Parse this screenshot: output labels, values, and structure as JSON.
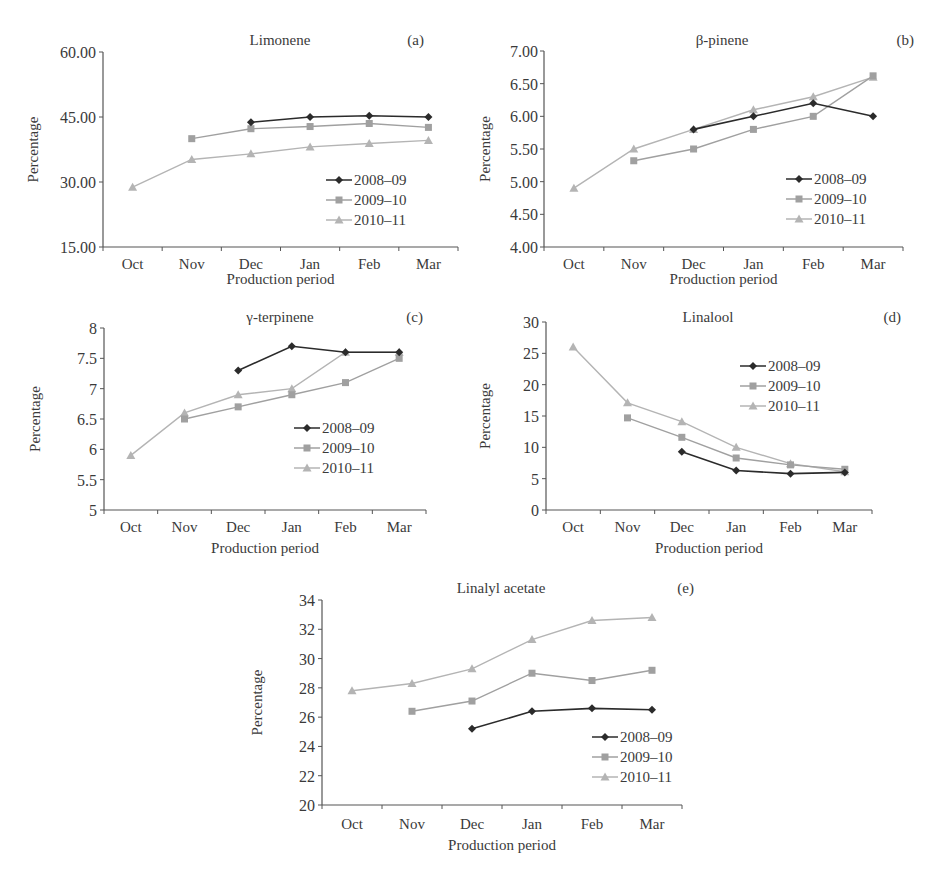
{
  "chart_data": [
    {
      "id": "a",
      "type": "line",
      "title": "Limonene",
      "panel_label": "(a)",
      "xlabel": "Production period",
      "ylabel": "Percentage",
      "categories": [
        "Oct",
        "Nov",
        "Dec",
        "Jan",
        "Feb",
        "Mar"
      ],
      "ylim": [
        15,
        60
      ],
      "yticks": [
        "15.00",
        "30.00",
        "45.00",
        "60.00"
      ],
      "ytick_values": [
        15,
        30,
        45,
        60
      ],
      "grid": false,
      "legend_position": "lower right",
      "series": [
        {
          "name": "2008–09",
          "values": [
            null,
            null,
            43.8,
            45.0,
            45.3,
            45.0
          ]
        },
        {
          "name": "2009–10",
          "values": [
            null,
            40.0,
            42.3,
            42.8,
            43.5,
            42.6
          ]
        },
        {
          "name": "2010–11",
          "values": [
            28.8,
            35.2,
            36.5,
            38.1,
            38.9,
            39.6
          ]
        }
      ]
    },
    {
      "id": "b",
      "type": "line",
      "title": "β-pinene",
      "panel_label": "(b)",
      "xlabel": "Production period",
      "ylabel": "Percentage",
      "categories": [
        "Oct",
        "Nov",
        "Dec",
        "Jan",
        "Feb",
        "Mar"
      ],
      "ylim": [
        4.0,
        7.0
      ],
      "yticks": [
        "4.00",
        "4.50",
        "5.00",
        "5.50",
        "6.00",
        "6.50",
        "7.00"
      ],
      "ytick_values": [
        4.0,
        4.5,
        5.0,
        5.5,
        6.0,
        6.5,
        7.0
      ],
      "grid": false,
      "legend_position": "lower right",
      "series": [
        {
          "name": "2008–09",
          "values": [
            null,
            null,
            5.8,
            6.0,
            6.2,
            6.0
          ]
        },
        {
          "name": "2009–10",
          "values": [
            null,
            5.32,
            5.5,
            5.8,
            6.0,
            6.62
          ]
        },
        {
          "name": "2010–11",
          "values": [
            4.9,
            5.5,
            5.8,
            6.1,
            6.3,
            6.6
          ]
        }
      ]
    },
    {
      "id": "c",
      "type": "line",
      "title": "γ-terpinene",
      "panel_label": "(c)",
      "xlabel": "Production period",
      "ylabel": "Percentage",
      "categories": [
        "Oct",
        "Nov",
        "Dec",
        "Jan",
        "Feb",
        "Mar"
      ],
      "ylim": [
        5,
        8
      ],
      "yticks": [
        "5",
        "5.5",
        "6",
        "6.5",
        "7",
        "7.5",
        "8"
      ],
      "ytick_values": [
        5,
        5.5,
        6,
        6.5,
        7,
        7.5,
        8
      ],
      "grid": false,
      "legend_position": "center right",
      "series": [
        {
          "name": "2008–09",
          "values": [
            null,
            null,
            7.3,
            7.7,
            7.6,
            7.6
          ]
        },
        {
          "name": "2009–10",
          "values": [
            null,
            6.5,
            6.7,
            6.9,
            7.1,
            7.5
          ]
        },
        {
          "name": "2010–11",
          "values": [
            5.9,
            6.6,
            6.9,
            7.0,
            7.6,
            7.6
          ]
        }
      ]
    },
    {
      "id": "d",
      "type": "line",
      "title": "Linalool",
      "panel_label": "(d)",
      "xlabel": "Production period",
      "ylabel": "Percentage",
      "categories": [
        "Oct",
        "Nov",
        "Dec",
        "Jan",
        "Feb",
        "Mar"
      ],
      "ylim": [
        0,
        30
      ],
      "yticks": [
        "0",
        "5",
        "10",
        "15",
        "20",
        "25",
        "30"
      ],
      "ytick_values": [
        0,
        5,
        10,
        15,
        20,
        25,
        30
      ],
      "grid": false,
      "legend_position": "upper right",
      "series": [
        {
          "name": "2008–09",
          "values": [
            null,
            null,
            9.3,
            6.3,
            5.8,
            6.0
          ]
        },
        {
          "name": "2009–10",
          "values": [
            null,
            14.7,
            11.6,
            8.3,
            7.2,
            6.5
          ]
        },
        {
          "name": "2010–11",
          "values": [
            26.0,
            17.1,
            14.1,
            10.0,
            7.4,
            6.1
          ]
        }
      ]
    },
    {
      "id": "e",
      "type": "line",
      "title": "Linalyl acetate",
      "panel_label": "(e)",
      "xlabel": "Production period",
      "ylabel": "Percentage",
      "categories": [
        "Oct",
        "Nov",
        "Dec",
        "Jan",
        "Feb",
        "Mar"
      ],
      "ylim": [
        20,
        34
      ],
      "yticks": [
        "20",
        "22",
        "24",
        "26",
        "28",
        "30",
        "32",
        "34"
      ],
      "ytick_values": [
        20,
        22,
        24,
        26,
        28,
        30,
        32,
        34
      ],
      "grid": false,
      "legend_position": "lower right",
      "series": [
        {
          "name": "2008–09",
          "values": [
            null,
            null,
            25.2,
            26.4,
            26.6,
            26.5
          ]
        },
        {
          "name": "2009–10",
          "values": [
            null,
            26.4,
            27.1,
            29.0,
            28.5,
            29.2
          ]
        },
        {
          "name": "2010–11",
          "values": [
            27.8,
            28.3,
            29.3,
            31.3,
            32.6,
            32.8
          ]
        }
      ]
    }
  ],
  "series_styles": [
    {
      "name": "2008–09",
      "color": "#2b2b2b",
      "marker": "diamond"
    },
    {
      "name": "2009–10",
      "color": "#a0a0a0",
      "marker": "square"
    },
    {
      "name": "2010–11",
      "color": "#b4b4b4",
      "marker": "triangle"
    }
  ]
}
